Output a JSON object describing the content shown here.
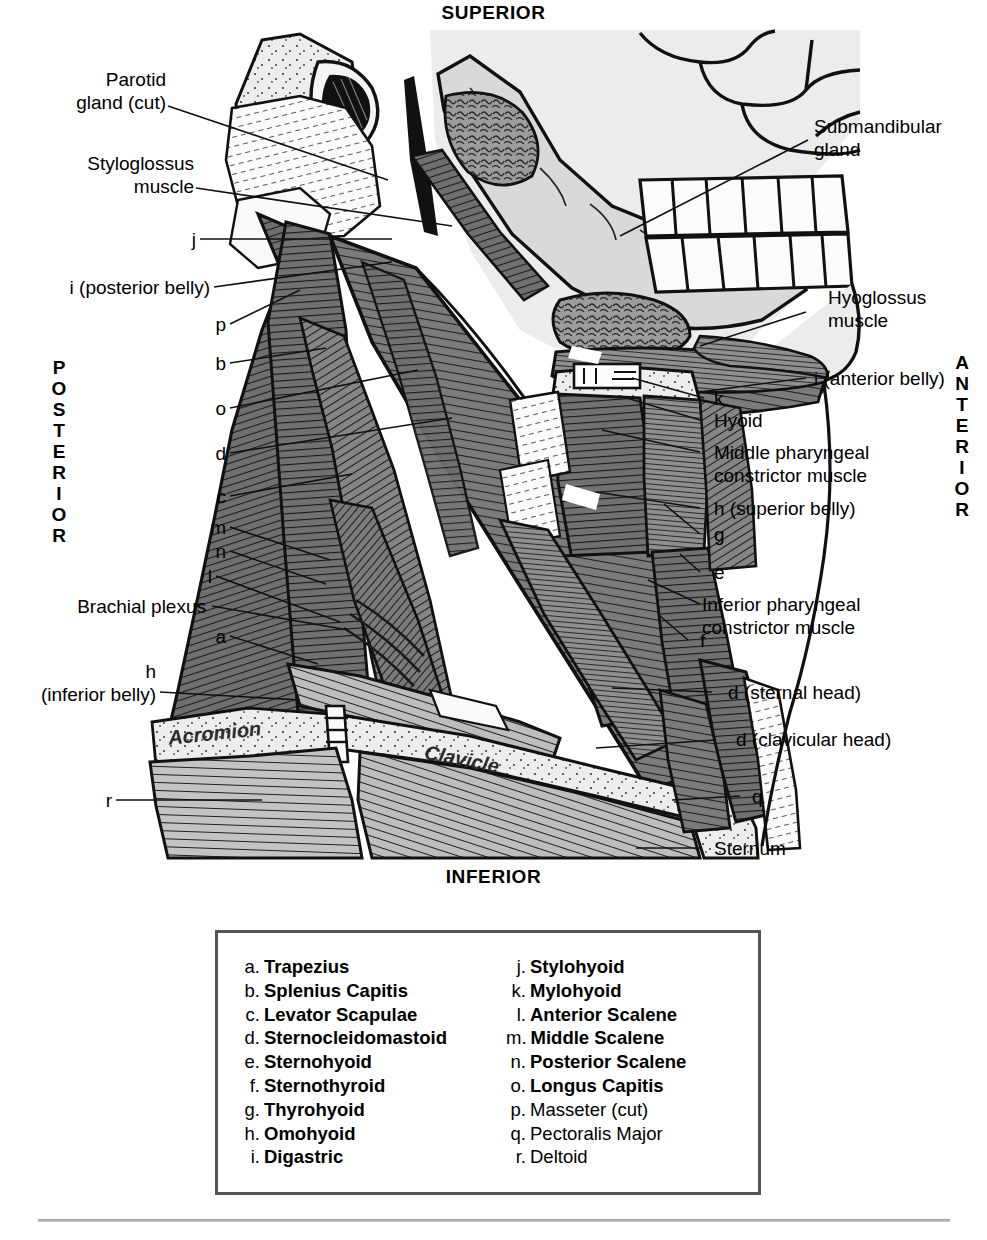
{
  "orientation": {
    "superior": "SUPERIOR",
    "inferior": "INFERIOR",
    "posterior": "POSTERIOR",
    "anterior": "ANTERIOR"
  },
  "labels_left": [
    {
      "id": "parotid-gland",
      "text": "Parotid\ngland (cut)"
    },
    {
      "id": "styloglossus-muscle",
      "text": "Styloglossus\nmuscle"
    },
    {
      "id": "j",
      "text": "j"
    },
    {
      "id": "i-posterior-belly",
      "text": "i (posterior belly)"
    },
    {
      "id": "p",
      "text": "p"
    },
    {
      "id": "b",
      "text": "b"
    },
    {
      "id": "o",
      "text": "o"
    },
    {
      "id": "d",
      "text": "d"
    },
    {
      "id": "c",
      "text": "c"
    },
    {
      "id": "m",
      "text": "m"
    },
    {
      "id": "n",
      "text": "n"
    },
    {
      "id": "l",
      "text": "l"
    },
    {
      "id": "brachial-plexus",
      "text": "Brachial plexus"
    },
    {
      "id": "a",
      "text": "a"
    },
    {
      "id": "h-inferior-belly",
      "text": "h\n(inferior belly)"
    },
    {
      "id": "r",
      "text": "r"
    }
  ],
  "labels_right": [
    {
      "id": "submandibular-gland",
      "text": "Submandibular\ngland"
    },
    {
      "id": "hyoglossus-muscle",
      "text": "Hyoglossus\nmuscle"
    },
    {
      "id": "i-anterior-belly",
      "text": "i (anterior belly)"
    },
    {
      "id": "k",
      "text": "k"
    },
    {
      "id": "hyoid",
      "text": "Hyoid"
    },
    {
      "id": "middle-pharyngeal-constrictor",
      "text": "Middle pharyngeal\nconstrictor muscle"
    },
    {
      "id": "h-superior-belly",
      "text": "h (superior belly)"
    },
    {
      "id": "g",
      "text": "g"
    },
    {
      "id": "e",
      "text": "e"
    },
    {
      "id": "inferior-pharyngeal-constrictor",
      "text": "Inferior pharyngeal\nconstrictor muscle"
    },
    {
      "id": "f",
      "text": "f"
    },
    {
      "id": "d-sternal-head",
      "text": "d (sternal head)"
    },
    {
      "id": "d-clavicular-head",
      "text": "d (clavicular head)"
    },
    {
      "id": "q",
      "text": "q"
    },
    {
      "id": "sternum",
      "text": "Sternum"
    }
  ],
  "bone_labels": [
    {
      "id": "acromion",
      "text": "Acromion"
    },
    {
      "id": "clavicle",
      "text": "Clavicle"
    }
  ],
  "legend": {
    "left_column": [
      {
        "key": "a.",
        "name": "Trapezius",
        "bold": true
      },
      {
        "key": "b.",
        "name": "Splenius Capitis",
        "bold": true
      },
      {
        "key": "c.",
        "name": "Levator Scapulae",
        "bold": true
      },
      {
        "key": "d.",
        "name": "Sternocleidomastoid",
        "bold": true
      },
      {
        "key": "e.",
        "name": "Sternohyoid",
        "bold": true
      },
      {
        "key": "f.",
        "name": "Sternothyroid",
        "bold": true
      },
      {
        "key": "g.",
        "name": "Thyrohyoid",
        "bold": true
      },
      {
        "key": "h.",
        "name": "Omohyoid",
        "bold": true
      },
      {
        "key": "i.",
        "name": "Digastric",
        "bold": true
      }
    ],
    "right_column": [
      {
        "key": "j.",
        "name": "Stylohyoid",
        "bold": true
      },
      {
        "key": "k.",
        "name": "Mylohyoid",
        "bold": true
      },
      {
        "key": "l.",
        "name": "Anterior Scalene",
        "bold": true
      },
      {
        "key": "m.",
        "name": "Middle Scalene",
        "bold": true
      },
      {
        "key": "n.",
        "name": "Posterior Scalene",
        "bold": true
      },
      {
        "key": "o.",
        "name": "Longus Capitis",
        "bold": true
      },
      {
        "key": "p.",
        "name": "Masseter (cut)",
        "bold": false
      },
      {
        "key": "q.",
        "name": "Pectoralis Major",
        "bold": false
      },
      {
        "key": "r.",
        "name": "Deltoid",
        "bold": false
      }
    ]
  },
  "colors": {
    "muscle_dark": "#6f6f6f",
    "muscle_mid": "#8a8a8a",
    "muscle_light": "#b9b9b9",
    "bone_light": "#e9e9e9",
    "bone_pale": "#f2f2f2",
    "gland": "#9b9b9b",
    "outline": "#111111",
    "background": "#ffffff"
  }
}
